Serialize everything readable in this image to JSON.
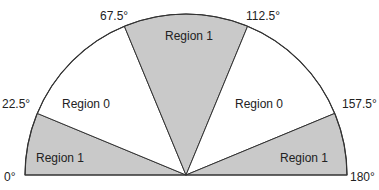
{
  "diagram": {
    "type": "semicircle-sector-partition",
    "center": {
      "x": 186,
      "y": 175
    },
    "radius": 161,
    "colors": {
      "region1_fill": "#c9c9c9",
      "region0_fill": "#ffffff",
      "stroke": "#333333",
      "text": "#222222"
    },
    "angle_labels": [
      {
        "text": "0°",
        "x": 4,
        "y": 181
      },
      {
        "text": "22.5°",
        "x": 2,
        "y": 108
      },
      {
        "text": "67.5°",
        "x": 100,
        "y": 20
      },
      {
        "text": "112.5°",
        "x": 246,
        "y": 20
      },
      {
        "text": "157.5°",
        "x": 342,
        "y": 108
      },
      {
        "text": "180°",
        "x": 350,
        "y": 181
      }
    ],
    "regions": [
      {
        "label": "Region 1",
        "from_deg": 0,
        "to_deg": 22.5,
        "shaded": true,
        "label_x": 36,
        "label_y": 162
      },
      {
        "label": "Region 0",
        "from_deg": 22.5,
        "to_deg": 67.5,
        "shaded": false,
        "label_x": 62,
        "label_y": 108
      },
      {
        "label": "Region 1",
        "from_deg": 67.5,
        "to_deg": 112.5,
        "shaded": true,
        "label_x": 165,
        "label_y": 40
      },
      {
        "label": "Region 0",
        "from_deg": 112.5,
        "to_deg": 157.5,
        "shaded": false,
        "label_x": 235,
        "label_y": 108
      },
      {
        "label": "Region 1",
        "from_deg": 157.5,
        "to_deg": 180,
        "shaded": true,
        "label_x": 280,
        "label_y": 162
      }
    ]
  }
}
